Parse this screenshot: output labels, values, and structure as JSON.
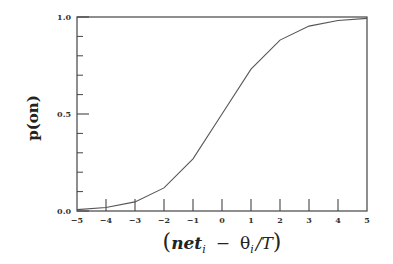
{
  "chart_data": {
    "type": "line",
    "title": "",
    "xlabel": "(net_i − θ_i / T)",
    "ylabel": "p(on)",
    "xlim": [
      -5,
      5
    ],
    "ylim": [
      0.0,
      1.0
    ],
    "x_ticks": [
      -5,
      -4,
      -3,
      -2,
      -1,
      0,
      1,
      2,
      3,
      4,
      5
    ],
    "x_tick_labels": [
      "−5",
      "−4",
      "−3",
      "−2",
      "−1",
      "0",
      "1",
      "2",
      "3",
      "4",
      "5"
    ],
    "y_ticks_labeled": [
      0.0,
      0.5,
      1.0
    ],
    "y_tick_labels": [
      "0.0",
      "0.5",
      "1.0"
    ],
    "y_minor_ticks": [
      0.1,
      0.2,
      0.3,
      0.4,
      0.6,
      0.7,
      0.8,
      0.9
    ],
    "grid": false,
    "legend": null,
    "series": [
      {
        "name": "logistic",
        "x": [
          -5,
          -4,
          -3,
          -2,
          -1,
          0,
          1,
          2,
          3,
          4,
          5
        ],
        "y": [
          0.007,
          0.018,
          0.047,
          0.119,
          0.269,
          0.5,
          0.731,
          0.881,
          0.953,
          0.982,
          0.993
        ]
      }
    ]
  },
  "labels": {
    "ylabel": "p(on)",
    "xlabel_open": "(",
    "xlabel_net": "net",
    "xlabel_sub_i": "i",
    "xlabel_minus": "−",
    "xlabel_theta": "θ",
    "xlabel_slash_T": "/T",
    "xlabel_close": ")"
  }
}
